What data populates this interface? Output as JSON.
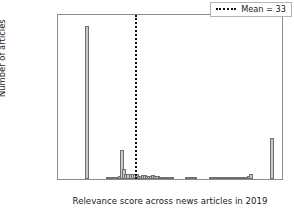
{
  "chart_data": {
    "type": "bar",
    "title": "",
    "xlabel": "Relevance score across news articles in 2019",
    "ylabel": "Number of articles",
    "xlim": [
      -4,
      104
    ],
    "ylim": [
      0,
      172000
    ],
    "grid": false,
    "bin_width": 2,
    "xticks": [
      0,
      20,
      40,
      60,
      80,
      100
    ],
    "xticklabels": [
      "0",
      "20",
      "40",
      "60",
      "80",
      "100"
    ],
    "yticks": [
      0,
      20000,
      40000,
      60000,
      80000,
      100000,
      120000,
      140000,
      160000
    ],
    "yticklabels": [
      "0",
      "20000",
      "40000",
      "60000",
      "80000",
      "100000",
      "120000",
      "140000",
      "160000"
    ],
    "bar_color": "#c9c9c9",
    "bar_edge_color": "#6f6f6f",
    "x": [
      10,
      20,
      21,
      23,
      25,
      26,
      27,
      28,
      29,
      30,
      31,
      32,
      33,
      34,
      35,
      36,
      37,
      38,
      39,
      40,
      41,
      42,
      43,
      44,
      45,
      46,
      47,
      48,
      49,
      50,
      51,
      58,
      59,
      60,
      61,
      62,
      70,
      72,
      74,
      76,
      78,
      80,
      82,
      83,
      84,
      85,
      86,
      87,
      88,
      89,
      99
    ],
    "values": [
      160200,
      900,
      2100,
      1100,
      2400,
      3000,
      30100,
      10700,
      5600,
      5600,
      5500,
      5300,
      5600,
      4900,
      3200,
      3100,
      4400,
      4400,
      3300,
      3000,
      3100,
      4000,
      3000,
      2900,
      2200,
      2000,
      1400,
      1200,
      900,
      700,
      400,
      500,
      900,
      1000,
      900,
      600,
      300,
      300,
      400,
      500,
      600,
      700,
      900,
      1000,
      1200,
      1400,
      1700,
      2000,
      3000,
      5300,
      42800
    ],
    "annotations": [
      {
        "type": "vline",
        "name": "mean-line",
        "x": 33,
        "style": "dotted",
        "color": "#111111"
      }
    ],
    "legend": {
      "position": "upper right",
      "entries": [
        {
          "label": "Mean = 33",
          "marker": "dotted-line",
          "color": "#111111"
        }
      ]
    }
  }
}
